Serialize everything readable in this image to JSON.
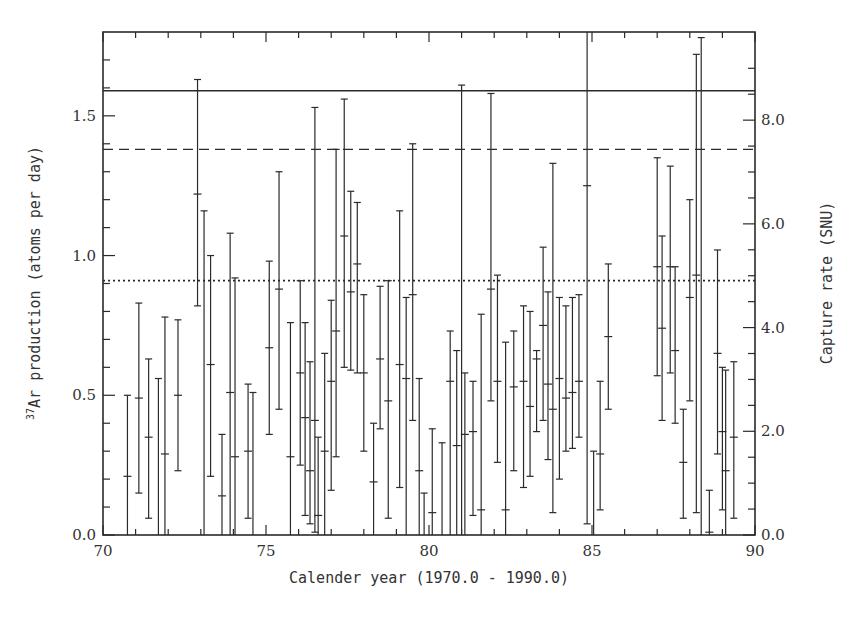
{
  "chart_data": {
    "type": "scatter",
    "title": "",
    "xlabel": "Calender year (1970.0 - 1990.0)",
    "ylabel": "37Ar production (atoms per day)",
    "ylabel_superscript": "37",
    "ylabel_rest": "Ar production (atoms per day)",
    "y2label": "Capture rate (SNU)",
    "xlim": [
      70,
      90
    ],
    "ylim": [
      0,
      1.8
    ],
    "y2lim": [
      0,
      9.7
    ],
    "x_ticks": [
      "70",
      "75",
      "80",
      "85",
      "90"
    ],
    "y_ticks": [
      "0.0",
      "0.5",
      "1.0",
      "1.5"
    ],
    "y2_ticks": [
      "0.0",
      "2.0",
      "4.0",
      "6.0",
      "8.0"
    ],
    "grid": false,
    "legend": null,
    "reference_lines": [
      {
        "style": "solid",
        "y": 1.59
      },
      {
        "style": "dashed",
        "y": 1.38
      },
      {
        "style": "dotted",
        "y": 0.91
      }
    ],
    "series": [
      {
        "name": "runs",
        "points": [
          {
            "x": 70.75,
            "y": 0.21,
            "lo": 0.0,
            "hi": 0.5
          },
          {
            "x": 71.1,
            "y": 0.49,
            "lo": 0.15,
            "hi": 0.83
          },
          {
            "x": 71.4,
            "y": 0.35,
            "lo": 0.06,
            "hi": 0.63
          },
          {
            "x": 71.7,
            "y": 0.0,
            "lo": 0.0,
            "hi": 0.56
          },
          {
            "x": 71.9,
            "y": 0.29,
            "lo": 0.0,
            "hi": 0.78
          },
          {
            "x": 72.3,
            "y": 0.5,
            "lo": 0.23,
            "hi": 0.77
          },
          {
            "x": 72.9,
            "y": 1.22,
            "lo": 0.82,
            "hi": 1.63
          },
          {
            "x": 73.1,
            "y": 0.0,
            "lo": 0.0,
            "hi": 1.16
          },
          {
            "x": 73.3,
            "y": 0.61,
            "lo": 0.21,
            "hi": 1.0
          },
          {
            "x": 73.65,
            "y": 0.14,
            "lo": 0.0,
            "hi": 0.36
          },
          {
            "x": 73.9,
            "y": 0.51,
            "lo": 0.0,
            "hi": 1.08
          },
          {
            "x": 74.05,
            "y": 0.28,
            "lo": 0.0,
            "hi": 0.92
          },
          {
            "x": 74.45,
            "y": 0.3,
            "lo": 0.06,
            "hi": 0.54
          },
          {
            "x": 74.6,
            "y": 0.0,
            "lo": 0.0,
            "hi": 0.51
          },
          {
            "x": 75.1,
            "y": 0.67,
            "lo": 0.36,
            "hi": 0.98
          },
          {
            "x": 75.4,
            "y": 0.88,
            "lo": 0.45,
            "hi": 1.3
          },
          {
            "x": 75.75,
            "y": 0.28,
            "lo": 0.0,
            "hi": 0.76
          },
          {
            "x": 76.05,
            "y": 0.58,
            "lo": 0.25,
            "hi": 0.91
          },
          {
            "x": 76.2,
            "y": 0.42,
            "lo": 0.07,
            "hi": 0.76
          },
          {
            "x": 76.35,
            "y": 0.23,
            "lo": 0.04,
            "hi": 0.62
          },
          {
            "x": 76.5,
            "y": 0.41,
            "lo": 0.01,
            "hi": 1.53
          },
          {
            "x": 76.6,
            "y": 0.07,
            "lo": 0.0,
            "hi": 0.35
          },
          {
            "x": 76.8,
            "y": 0.3,
            "lo": 0.0,
            "hi": 0.65
          },
          {
            "x": 77.0,
            "y": 0.55,
            "lo": 0.16,
            "hi": 0.84
          },
          {
            "x": 77.15,
            "y": 0.73,
            "lo": 0.28,
            "hi": 1.38
          },
          {
            "x": 77.4,
            "y": 1.07,
            "lo": 0.6,
            "hi": 1.56
          },
          {
            "x": 77.6,
            "y": 0.87,
            "lo": 0.59,
            "hi": 1.23
          },
          {
            "x": 77.8,
            "y": 0.97,
            "lo": 0.58,
            "hi": 1.19
          },
          {
            "x": 78.0,
            "y": 0.58,
            "lo": 0.3,
            "hi": 0.86
          },
          {
            "x": 78.3,
            "y": 0.19,
            "lo": 0.0,
            "hi": 0.4
          },
          {
            "x": 78.5,
            "y": 0.63,
            "lo": 0.38,
            "hi": 0.89
          },
          {
            "x": 78.75,
            "y": 0.48,
            "lo": 0.06,
            "hi": 0.91
          },
          {
            "x": 79.1,
            "y": 0.61,
            "lo": 0.17,
            "hi": 1.16
          },
          {
            "x": 79.3,
            "y": 0.56,
            "lo": 0.0,
            "hi": 0.85
          },
          {
            "x": 79.5,
            "y": 0.86,
            "lo": 0.41,
            "hi": 1.4
          },
          {
            "x": 79.7,
            "y": 0.23,
            "lo": 0.0,
            "hi": 0.56
          },
          {
            "x": 79.85,
            "y": 0.0,
            "lo": 0.0,
            "hi": 0.15
          },
          {
            "x": 80.1,
            "y": 0.08,
            "lo": 0.0,
            "hi": 0.38
          },
          {
            "x": 80.4,
            "y": 0.0,
            "lo": 0.0,
            "hi": 0.33
          },
          {
            "x": 80.65,
            "y": 0.55,
            "lo": 0.0,
            "hi": 0.73
          },
          {
            "x": 80.85,
            "y": 0.32,
            "lo": 0.0,
            "hi": 0.66
          },
          {
            "x": 81.0,
            "y": 0.0,
            "lo": 0.0,
            "hi": 1.61
          },
          {
            "x": 81.1,
            "y": 0.36,
            "lo": 0.0,
            "hi": 0.58
          },
          {
            "x": 81.35,
            "y": 0.37,
            "lo": 0.07,
            "hi": 0.55
          },
          {
            "x": 81.6,
            "y": 0.09,
            "lo": 0.0,
            "hi": 0.79
          },
          {
            "x": 81.9,
            "y": 0.88,
            "lo": 0.48,
            "hi": 1.58
          },
          {
            "x": 82.1,
            "y": 0.55,
            "lo": 0.26,
            "hi": 0.93
          },
          {
            "x": 82.35,
            "y": 0.09,
            "lo": 0.0,
            "hi": 0.69
          },
          {
            "x": 82.6,
            "y": 0.53,
            "lo": 0.23,
            "hi": 0.73
          },
          {
            "x": 82.9,
            "y": 0.55,
            "lo": 0.17,
            "hi": 0.82
          },
          {
            "x": 83.1,
            "y": 0.46,
            "lo": 0.21,
            "hi": 0.8
          },
          {
            "x": 83.3,
            "y": 0.63,
            "lo": 0.37,
            "hi": 0.66
          },
          {
            "x": 83.5,
            "y": 0.75,
            "lo": 0.41,
            "hi": 1.03
          },
          {
            "x": 83.65,
            "y": 0.54,
            "lo": 0.27,
            "hi": 0.87
          },
          {
            "x": 83.8,
            "y": 0.45,
            "lo": 0.08,
            "hi": 1.33
          },
          {
            "x": 84.0,
            "y": 0.56,
            "lo": 0.2,
            "hi": 0.85
          },
          {
            "x": 84.2,
            "y": 0.49,
            "lo": 0.3,
            "hi": 0.82
          },
          {
            "x": 84.4,
            "y": 0.51,
            "lo": 0.31,
            "hi": 0.85
          },
          {
            "x": 84.6,
            "y": 0.55,
            "lo": 0.35,
            "hi": 0.86
          },
          {
            "x": 84.85,
            "y": 1.25,
            "lo": 0.04,
            "hi": 1.8
          },
          {
            "x": 85.05,
            "y": 0.0,
            "lo": 0.0,
            "hi": 0.3
          },
          {
            "x": 85.25,
            "y": 0.29,
            "lo": 0.09,
            "hi": 0.55
          },
          {
            "x": 85.5,
            "y": 0.71,
            "lo": 0.45,
            "hi": 0.97
          },
          {
            "x": 87.0,
            "y": 0.96,
            "lo": 0.57,
            "hi": 1.35
          },
          {
            "x": 87.15,
            "y": 0.74,
            "lo": 0.41,
            "hi": 1.07
          },
          {
            "x": 87.4,
            "y": 0.96,
            "lo": 0.58,
            "hi": 1.32
          },
          {
            "x": 87.55,
            "y": 0.66,
            "lo": 0.4,
            "hi": 0.96
          },
          {
            "x": 87.8,
            "y": 0.26,
            "lo": 0.06,
            "hi": 0.45
          },
          {
            "x": 88.0,
            "y": 0.85,
            "lo": 0.48,
            "hi": 1.2
          },
          {
            "x": 88.2,
            "y": 0.93,
            "lo": 0.08,
            "hi": 1.72
          },
          {
            "x": 88.35,
            "y": 0.0,
            "lo": 0.0,
            "hi": 1.78
          },
          {
            "x": 88.6,
            "y": 0.01,
            "lo": 0.0,
            "hi": 0.16
          },
          {
            "x": 88.85,
            "y": 0.65,
            "lo": 0.29,
            "hi": 1.02
          },
          {
            "x": 89.0,
            "y": 0.37,
            "lo": 0.09,
            "hi": 0.6
          },
          {
            "x": 89.1,
            "y": 0.23,
            "lo": 0.0,
            "hi": 0.59
          },
          {
            "x": 89.35,
            "y": 0.35,
            "lo": 0.06,
            "hi": 0.62
          }
        ]
      }
    ]
  }
}
